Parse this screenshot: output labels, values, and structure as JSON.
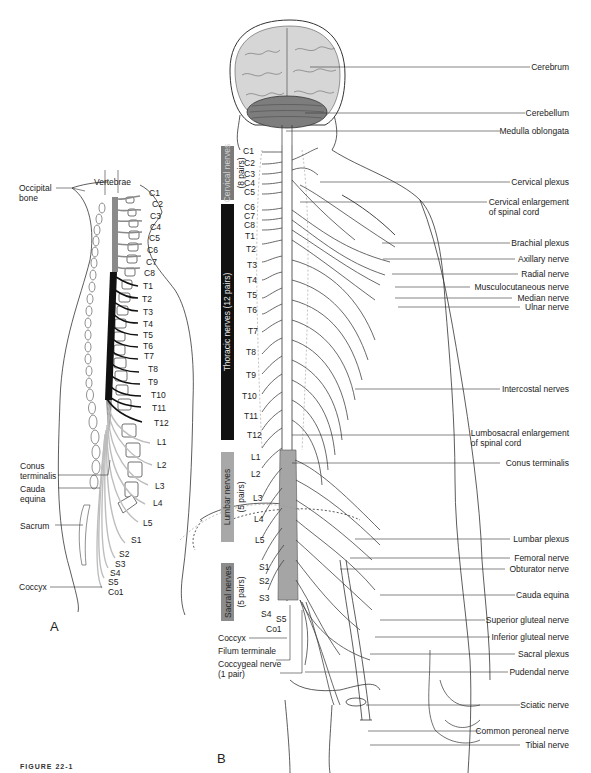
{
  "figure": {
    "caption": "FIGURE 22-1",
    "panel_labels": {
      "a": "A",
      "b": "B"
    }
  },
  "panel_a": {
    "labels_left": [
      {
        "id": "occipital",
        "text": "Occipital\nbone",
        "line1": "Occipital",
        "line2": "bone"
      },
      {
        "id": "conus",
        "line1": "Conus",
        "line2": "terminalis"
      },
      {
        "id": "cauda",
        "line1": "Cauda",
        "line2": "equina"
      },
      {
        "id": "sacrum",
        "line1": "Sacrum"
      },
      {
        "id": "coccyx",
        "line1": "Coccyx"
      }
    ],
    "vertebrae_label": "Vertebrae",
    "segments": [
      "C1",
      "C2",
      "C3",
      "C4",
      "C5",
      "C6",
      "C7",
      "C8",
      "T1",
      "T2",
      "T3",
      "T4",
      "T5",
      "T6",
      "T7",
      "T8",
      "T9",
      "T10",
      "T11",
      "T12",
      "L1",
      "L2",
      "L3",
      "L4",
      "L5",
      "S1",
      "S2",
      "S3",
      "S4",
      "S5",
      "Co1"
    ],
    "colors": {
      "cervical": "#8a8a8a",
      "thoracic": "#111111",
      "lumbar_sacral": "#bdbdbd"
    }
  },
  "panel_b": {
    "bands": [
      {
        "label": "Cervical nerves",
        "sub": "(8 pairs)",
        "color": "#7a7a7a",
        "text_color": "#d0d0d0"
      },
      {
        "label": "Thoracic nerves (12 pairs)",
        "sub": "",
        "color": "#111111",
        "text_color": "#e6e6e6"
      },
      {
        "label": "Lumbar nerves",
        "sub": "(5 pairs)",
        "color": "#a8a8a8",
        "text_color": "#2a2a2a"
      },
      {
        "label": "Sacral nerves",
        "sub": "(5 pairs)",
        "color": "#8c8c8c",
        "text_color": "#2a2a2a"
      }
    ],
    "segments": [
      "C1",
      "C2",
      "C3",
      "C4",
      "C5",
      "C6",
      "C7",
      "C8",
      "T1",
      "T2",
      "T3",
      "T4",
      "T5",
      "T6",
      "T7",
      "T8",
      "T9",
      "T10",
      "T11",
      "T12",
      "L1",
      "L2",
      "L3",
      "L4",
      "L5",
      "S1",
      "S2",
      "S3",
      "S4",
      "S5",
      "Co1"
    ],
    "labels_left": [
      "Coccyx",
      "Filum terminale",
      "Coccygeal nerve",
      "(1 pair)"
    ],
    "labels_right": [
      {
        "line1": "Cerebrum"
      },
      {
        "line1": "Cerebellum"
      },
      {
        "line1": "Medulla oblongata"
      },
      {
        "line1": "Cervical plexus"
      },
      {
        "line1": "Cervical enlargement",
        "line2": "of spinal cord"
      },
      {
        "line1": "Brachial plexus"
      },
      {
        "line1": "Axillary nerve"
      },
      {
        "line1": "Radial nerve"
      },
      {
        "line1": "Musculocutaneous nerve"
      },
      {
        "line1": "Median nerve"
      },
      {
        "line1": "Ulnar nerve"
      },
      {
        "line1": "Intercostal nerves"
      },
      {
        "line1": "Lumbosacral enlargement",
        "line2": "of spinal cord"
      },
      {
        "line1": "Conus terminalis"
      },
      {
        "line1": "Lumbar plexus"
      },
      {
        "line1": "Femoral nerve"
      },
      {
        "line1": "Obturator nerve"
      },
      {
        "line1": "Cauda equina"
      },
      {
        "line1": "Superior gluteal nerve"
      },
      {
        "line1": "Inferior gluteal nerve"
      },
      {
        "line1": "Sacral plexus"
      },
      {
        "line1": "Pudendal nerve"
      },
      {
        "line1": "Sciatic nerve"
      },
      {
        "line1": "Common peroneal nerve"
      },
      {
        "line1": "Tibial nerve"
      }
    ]
  }
}
